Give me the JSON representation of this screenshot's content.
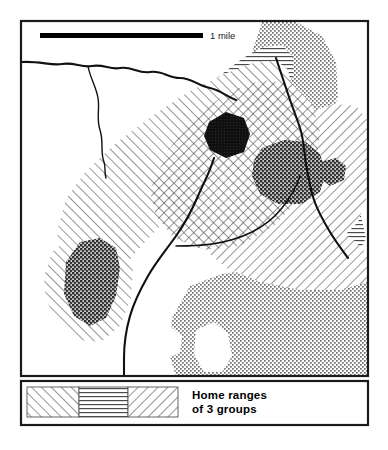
{
  "figure": {
    "kind": "map",
    "title_visible": false,
    "background_color": "#ffffff",
    "frame_color": "#1a1a1a"
  },
  "scale_bar": {
    "label": "1 mile",
    "bar_color": "#000000",
    "bar_x_start": 40,
    "bar_x_end": 203,
    "bar_y": 35,
    "bar_thickness": 5,
    "label_x": 210,
    "label_y": 38
  },
  "map_frame": {
    "x": 21,
    "y": 21,
    "width": 347,
    "height": 355,
    "stroke_width": 2.2
  },
  "legend": {
    "box": {
      "x": 21,
      "y": 381,
      "width": 347,
      "height": 44,
      "stroke_width": 2.2
    },
    "swatches": [
      {
        "name": "group-1-swatch",
        "pattern": "diagonal-up-hatch",
        "x": 27,
        "y": 387,
        "width": 52,
        "height": 30
      },
      {
        "name": "group-2-swatch",
        "pattern": "horizontal-line-hatch",
        "x": 79,
        "y": 387,
        "width": 49,
        "height": 30
      },
      {
        "name": "group-3-swatch",
        "pattern": "diagonal-down-hatch",
        "x": 128,
        "y": 387,
        "width": 50,
        "height": 30
      }
    ],
    "caption_line_1": "Home ranges",
    "caption_line_2": "of 3 groups",
    "caption_x": 192,
    "caption_y_1": 398,
    "caption_y_2": 412
  },
  "map_layers": {
    "home_ranges": [
      {
        "name": "home-range-group-1",
        "pattern": "diagonal-up-hatch",
        "description": "Large NW-SE trending range across center-left of map",
        "path": "M 62,262 L 57,231 L 66,199 L 86,171 L 116,143 L 152,116 L 188,92 L 224,74 L 256,62 L 276,61 L 288,69 L 291,85 L 281,106 L 260,131 L 232,158 L 202,186 L 172,214 L 146,241 L 124,266 L 106,287 L 90,296 L 74,289 Z"
      },
      {
        "name": "home-range-group-1-lobe",
        "pattern": "diagonal-up-hatch",
        "description": "Lower-left lobe of group 1 range",
        "path": "M 44,277 L 52,252 L 72,236 L 98,232 L 122,243 L 133,266 L 131,298 L 120,326 L 101,342 L 78,340 L 58,322 L 46,300 Z"
      },
      {
        "name": "home-range-group-2",
        "pattern": "horizontal-line-hatch",
        "description": "Band running from upper-center toward right edge",
        "path": "M 180,120 L 196,98 L 218,77 L 243,58 L 264,47 L 282,45 L 292,56 L 293,74 L 285,96 L 268,122 L 292,138 L 320,160 L 344,186 L 360,212 L 366,238 L 356,258 L 330,258 L 300,240 L 268,214 L 238,186 L 212,158 L 192,138 Z"
      },
      {
        "name": "home-range-group-3",
        "pattern": "diagonal-down-hatch",
        "description": "Right-side range extending to map edge",
        "path": "M 286,128 L 310,112 L 334,104 L 356,106 L 367,120 L 367,196 L 358,222 L 340,240 L 316,246 L 292,236 L 274,216 L 266,190 L 268,162 Z"
      },
      {
        "name": "home-range-group-3-lower",
        "pattern": "diagonal-down-hatch",
        "description": "Lower extension of group 3 range toward right edge",
        "path": "M 212,238 L 244,226 L 282,222 L 320,226 L 352,238 L 367,254 L 367,282 L 340,290 L 300,290 L 260,282 L 226,268 L 210,254 Z"
      }
    ],
    "crosshatch_overlap": [
      {
        "name": "overlap-zone-center",
        "pattern": "crosshatch",
        "description": "Core overlap area in center of map where ranges intersect",
        "path": "M 150,190 L 168,150 L 196,116 L 228,92 L 262,80 L 292,84 L 312,104 L 320,132 L 316,166 L 300,198 L 274,226 L 240,246 L 204,250 L 174,238 L 156,216 Z"
      }
    ],
    "stipple_regions": [
      {
        "name": "stipple-region-upper-right",
        "shade": "medium",
        "description": "Dotted lobe at top right of map",
        "path": "M 262,22 L 296,22 L 322,36 L 336,62 L 338,96 L 328,126 L 308,146 L 284,150 L 266,136 L 258,112 L 258,80 L 252,52 Z"
      },
      {
        "name": "stipple-region-lower-right",
        "shade": "medium",
        "description": "Large dotted area filling bottom right quadrant",
        "path": "M 190,286 L 222,274 L 262,268 L 310,268 L 352,274 L 367,282 L 367,376 L 176,376 L 168,350 L 172,318 Z"
      },
      {
        "name": "stipple-hole-a",
        "shade": "white",
        "description": "White gap inside lower-right stipple region",
        "path": "M 196,330 L 214,322 L 228,334 L 232,356 L 222,372 L 204,372 L 194,354 Z"
      },
      {
        "name": "stipple-hole-b",
        "shade": "white",
        "description": "Second white gap inside lower-right stipple region",
        "path": "M 156,334 L 170,326 L 182,336 L 180,352 L 166,360 L 154,350 Z"
      }
    ],
    "core_areas": [
      {
        "name": "core-area-dark-center",
        "shade": "very-dark",
        "description": "Small near-solid dark polygon in center of map",
        "path": "M 209,122 L 226,112 L 244,118 L 250,134 L 244,152 L 226,158 L 210,150 L 204,136 Z"
      },
      {
        "name": "core-area-dark-right",
        "shade": "dark",
        "description": "Dark stippled core region right of center",
        "path": "M 262,148 L 284,140 L 306,142 L 320,154 L 326,172 L 320,192 L 302,204 L 278,204 L 260,194 L 252,176 L 254,160 Z"
      },
      {
        "name": "core-area-dark-right-small",
        "shade": "dark",
        "description": "Small dark patch at far right of center cluster",
        "path": "M 320,162 L 336,158 L 346,166 L 344,180 L 330,186 L 320,178 Z"
      },
      {
        "name": "core-area-dark-lowerleft",
        "shade": "dark",
        "description": "Dark stippled core in lower-left lobe",
        "path": "M 66,262 L 80,242 L 100,238 L 116,248 L 120,268 L 116,296 L 106,318 L 90,326 L 74,316 L 64,294 Z"
      }
    ],
    "rivers": [
      {
        "name": "river-north-main",
        "description": "River entering from left border running east then southeast",
        "path": "M 22,62 C 40,61 52,66 62,64 C 74,62 82,68 92,66 C 104,64 110,70 120,68 C 132,66 138,74 150,72 C 162,70 168,78 180,78 C 192,78 198,86 210,88 C 220,90 226,96 236,100"
      },
      {
        "name": "river-north-branch",
        "description": "Tributary branching south from the main north river",
        "path": "M 88,66 C 90,78 96,86 98,98 C 100,110 96,118 100,130 C 104,142 100,152 104,162 C 106,168 104,172 106,178"
      },
      {
        "name": "river-central",
        "description": "Long river descending through center of the map to bottom border",
        "path": "M 214,158 C 210,172 204,182 198,196 C 192,210 186,222 176,236 C 166,250 156,262 148,276 C 140,290 134,302 130,316 C 126,330 124,344 124,358 C 124,366 124,372 124,376"
      },
      {
        "name": "river-east",
        "description": "River running down the right side of the map toward right border",
        "path": "M 276,58 C 280,70 284,82 288,94 C 292,106 296,116 300,128 C 304,140 304,152 306,164 C 308,176 310,188 314,200 C 318,212 324,222 330,232 C 336,242 342,250 348,258"
      },
      {
        "name": "river-east-lower",
        "description": "Lower branch of the east river reaching the right border",
        "path": "M 300,176 C 296,188 290,198 282,208 C 274,218 264,226 252,232 C 240,238 226,242 212,244 C 198,246 186,246 176,246"
      }
    ]
  }
}
